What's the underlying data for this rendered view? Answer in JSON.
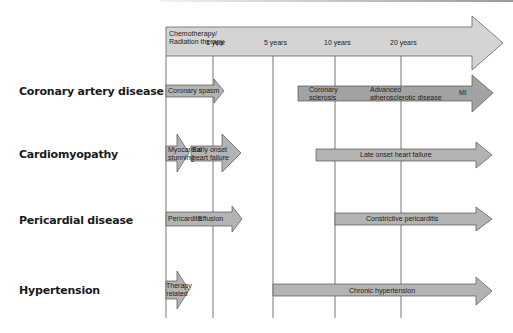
{
  "timeline": {
    "start_label": "Chemotherapy/\nRadiation therapy",
    "start_line1": "Chemotherapy/",
    "start_line2": "Radiation therapy",
    "ticks": [
      "1 year",
      "5 years",
      "10 years",
      "20 years"
    ]
  },
  "rows": [
    {
      "label": "Coronary artery disease",
      "phases": [
        {
          "text": "Coronary spasm"
        },
        {
          "line1": "Coronary",
          "line2": "sclerosis"
        },
        {
          "line1": "Advanced",
          "line2": "atherosclerotic disease"
        },
        {
          "text": "MI"
        }
      ]
    },
    {
      "label": "Cardiomyopathy",
      "phases": [
        {
          "line1": "Myocardial",
          "line2": "stunning"
        },
        {
          "line1": "Early onset",
          "line2": "heart failure"
        },
        {
          "text": "Late onset heart failure"
        }
      ]
    },
    {
      "label": "Pericardial disease",
      "phases": [
        {
          "text": "Pericarditis"
        },
        {
          "text": "Effusion"
        },
        {
          "text": "Constrictive pericarditis"
        }
      ]
    },
    {
      "label": "Hypertension",
      "phases": [
        {
          "line1": "Therapy",
          "line2": "related"
        },
        {
          "text": "Chronic hypertension"
        }
      ]
    }
  ],
  "colors": {
    "timeline_arrow": "#d4d4d4",
    "phase_arrow": "#b3b3b3",
    "advanced_arrow": "#a2a2a2",
    "outline": "#555555",
    "grid_line": "#666666"
  }
}
